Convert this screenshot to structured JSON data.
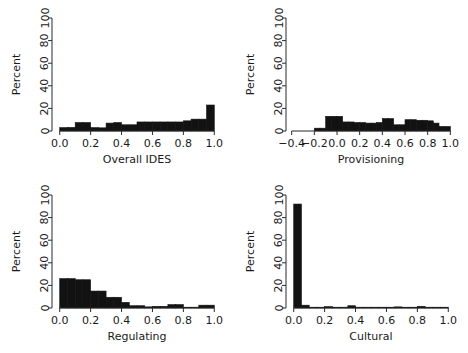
{
  "figure": {
    "type": "multi-panel-histogram-figure",
    "panel_count": 4,
    "layout": "2x2",
    "background": "#ffffff",
    "bar_color": "#121212",
    "axis_color": "#2b2b2b"
  },
  "chart_data": [
    {
      "type": "bar",
      "title": "",
      "xlabel": "Overall IDES",
      "ylabel": "Percent",
      "xlim": [
        -0.05,
        1.05
      ],
      "ylim": [
        0,
        100
      ],
      "xticks": [
        0.0,
        0.2,
        0.4,
        0.6,
        0.8,
        1.0
      ],
      "xticklabels": [
        "0.0",
        "0.2",
        "0.4",
        "0.6",
        "0.8",
        "1.0"
      ],
      "yticks": [
        0,
        20,
        40,
        60,
        80,
        100
      ],
      "yticklabels": [
        "0",
        "20",
        "40",
        "60",
        "80",
        "100"
      ],
      "grid": false,
      "legend": "none",
      "bin_width": 0.05,
      "bin_edges": [
        0.0,
        0.05,
        0.1,
        0.15,
        0.2,
        0.25,
        0.3,
        0.35,
        0.4,
        0.45,
        0.5,
        0.55,
        0.6,
        0.65,
        0.7,
        0.75,
        0.8,
        0.85,
        0.9,
        0.95,
        1.0
      ],
      "values": [
        3.0,
        3.2,
        7.5,
        7.5,
        3.0,
        2.8,
        7.0,
        7.5,
        5.5,
        5.5,
        8.0,
        8.0,
        8.0,
        8.0,
        8.0,
        8.0,
        9.0,
        10.5,
        10.5,
        23.0
      ]
    },
    {
      "type": "bar",
      "title": "",
      "xlabel": "Provisioning",
      "ylabel": "Percent",
      "xlim": [
        -0.45,
        1.05
      ],
      "ylim": [
        0,
        100
      ],
      "xticks": [
        -0.4,
        -0.2,
        0.0,
        0.2,
        0.4,
        0.6,
        0.8,
        1.0
      ],
      "xticklabels": [
        "−0.4",
        "−0.2",
        "0.0",
        "0.2",
        "0.4",
        "0.6",
        "0.8",
        "1.0"
      ],
      "yticks": [
        0,
        20,
        40,
        60,
        80,
        100
      ],
      "yticklabels": [
        "0",
        "20",
        "40",
        "60",
        "80",
        "100"
      ],
      "grid": false,
      "legend": "none",
      "bin_width": 0.05,
      "bin_edges": [
        -0.2,
        -0.15,
        -0.1,
        -0.05,
        0.0,
        0.05,
        0.1,
        0.15,
        0.2,
        0.25,
        0.3,
        0.35,
        0.4,
        0.45,
        0.5,
        0.55,
        0.6,
        0.65,
        0.7,
        0.75,
        0.8,
        0.85,
        0.9,
        0.95,
        1.0
      ],
      "values": [
        2.5,
        2.5,
        13.0,
        13.0,
        13.0,
        8.0,
        8.0,
        7.5,
        7.5,
        7.0,
        7.0,
        7.5,
        11.0,
        11.0,
        5.5,
        5.5,
        10.0,
        10.0,
        9.5,
        9.5,
        9.0,
        7.0,
        4.0,
        4.0
      ]
    },
    {
      "type": "bar",
      "title": "",
      "xlabel": "Regulating",
      "ylabel": "Percent",
      "xlim": [
        -0.05,
        1.05
      ],
      "ylim": [
        0,
        100
      ],
      "xticks": [
        0.0,
        0.2,
        0.4,
        0.6,
        0.8,
        1.0
      ],
      "xticklabels": [
        "0.0",
        "0.2",
        "0.4",
        "0.6",
        "0.8",
        "1.0"
      ],
      "yticks": [
        0,
        20,
        40,
        60,
        80,
        100
      ],
      "yticklabels": [
        "0",
        "20",
        "40",
        "60",
        "80",
        "100"
      ],
      "grid": false,
      "legend": "none",
      "bin_width": 0.05,
      "bin_edges": [
        0.0,
        0.05,
        0.1,
        0.15,
        0.2,
        0.25,
        0.3,
        0.35,
        0.4,
        0.45,
        0.5,
        0.55,
        0.6,
        0.65,
        0.7,
        0.75,
        0.8,
        0.85,
        0.9,
        0.95,
        1.0
      ],
      "values": [
        26.0,
        26.0,
        25.0,
        25.0,
        15.0,
        15.0,
        9.5,
        9.5,
        5.0,
        2.0,
        2.0,
        1.0,
        1.5,
        1.5,
        3.0,
        3.0,
        0.5,
        0.5,
        2.5,
        2.5
      ]
    },
    {
      "type": "bar",
      "title": "",
      "xlabel": "Cultural",
      "ylabel": "Percent",
      "xlim": [
        -0.05,
        1.05
      ],
      "ylim": [
        0,
        100
      ],
      "xticks": [
        0.0,
        0.2,
        0.4,
        0.6,
        0.8,
        1.0
      ],
      "xticklabels": [
        "0.0",
        "0.2",
        "0.4",
        "0.6",
        "0.8",
        "1.0"
      ],
      "yticks": [
        0,
        20,
        40,
        60,
        80,
        100
      ],
      "yticklabels": [
        "0",
        "20",
        "40",
        "60",
        "80",
        "100"
      ],
      "grid": false,
      "legend": "none",
      "bin_width": 0.05,
      "bin_edges": [
        0.0,
        0.05,
        0.1,
        0.15,
        0.2,
        0.25,
        0.3,
        0.35,
        0.4,
        0.45,
        0.5,
        0.55,
        0.6,
        0.65,
        0.7,
        0.75,
        0.8,
        0.85,
        0.9,
        0.95,
        1.0
      ],
      "values": [
        92.0,
        2.5,
        0.2,
        0.2,
        1.2,
        0.2,
        0.2,
        2.0,
        0.2,
        0.2,
        0.2,
        0.2,
        0.2,
        1.0,
        0.2,
        0.2,
        1.5,
        0.2,
        0.2,
        0.2
      ]
    }
  ]
}
